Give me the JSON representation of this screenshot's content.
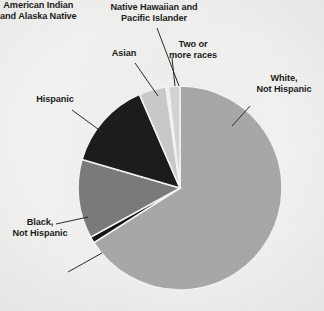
{
  "figure": {
    "background_color": "#f3f3f1",
    "center": {
      "x": 180,
      "y": 188
    },
    "radius": 102
  },
  "chart_data": {
    "type": "pie",
    "title": "",
    "subtitle": "",
    "xlabel": "",
    "ylabel": "",
    "grid": false,
    "legend_position": "none",
    "label_placement": "outside-with-leader-lines",
    "start_angle_deg": -90,
    "direction": "clockwise",
    "categories": [
      "White, Not Hispanic",
      "American Indian and Alaska Native",
      "Black, Not Hispanic",
      "Hispanic",
      "Asian",
      "Native Hawaiian and Pacific Islander",
      "Two or more races"
    ],
    "values": [
      66.0,
      1.0,
      12.5,
      14.0,
      4.3,
      0.4,
      1.8
    ],
    "units": "percent",
    "colors": [
      "#a8a8a8",
      "#141414",
      "#7b7b7b",
      "#1c1c1c",
      "#c9c9c9",
      "#eeeeee",
      "#d4d4d4"
    ],
    "slices": [
      {
        "label": "White, Not Hispanic",
        "value": 66.0,
        "color": "#a8a8a8",
        "start_deg": -90.0,
        "end_deg": 147.6
      },
      {
        "label": "American Indian and Alaska Native",
        "value": 1.0,
        "color": "#141414",
        "start_deg": 147.6,
        "end_deg": 151.2
      },
      {
        "label": "Black, Not Hispanic",
        "value": 12.5,
        "color": "#7b7b7b",
        "start_deg": 151.2,
        "end_deg": 196.2
      },
      {
        "label": "Hispanic",
        "value": 14.0,
        "color": "#1c1c1c",
        "start_deg": 196.2,
        "end_deg": 246.6
      },
      {
        "label": "Asian",
        "value": 4.3,
        "color": "#c9c9c9",
        "start_deg": 246.6,
        "end_deg": 262.1
      },
      {
        "label": "Native Hawaiian and Pacific Islander",
        "value": 0.4,
        "color": "#eeeeee",
        "start_deg": 262.1,
        "end_deg": 263.5
      },
      {
        "label": "Two or more races",
        "value": 1.8,
        "color": "#d4d4d4",
        "start_deg": 263.5,
        "end_deg": 270.0
      }
    ]
  },
  "labels": {
    "native_hawaiian": "Native Hawaiian and\nPacific Islander",
    "asian": "Asian",
    "two_or_more": "Two or\nmore races",
    "white": "White,\nNot Hispanic",
    "hispanic": "Hispanic",
    "black": "Black,\nNot Hispanic",
    "american_indian": "American Indian\nand Alaska Native"
  }
}
